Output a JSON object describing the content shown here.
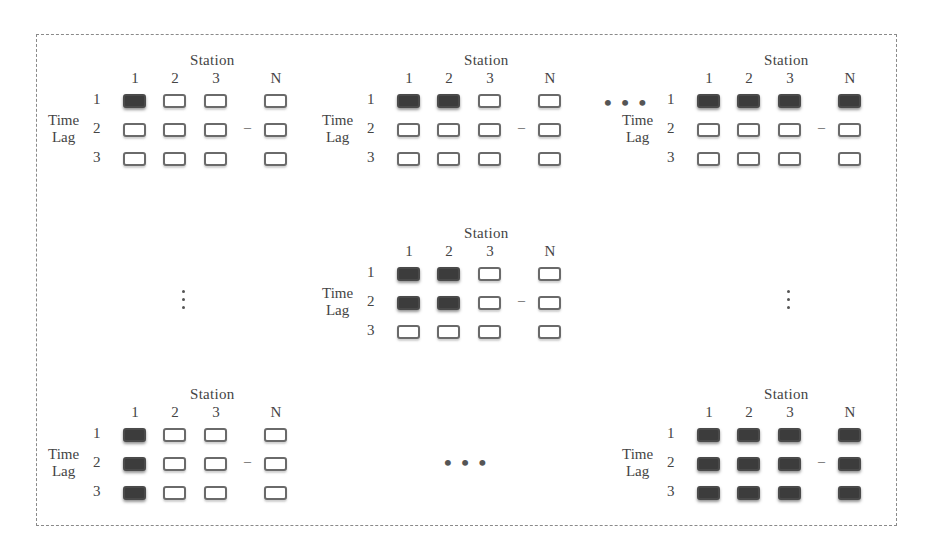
{
  "diagram": {
    "type": "grid-panels",
    "row_axis_label": [
      "Time",
      "Lag"
    ],
    "column_axis_label": "Station",
    "column_labels": [
      "1",
      "2",
      "3",
      "N"
    ],
    "row_labels": [
      "1",
      "2",
      "3"
    ],
    "between_col_ellipsis": "–",
    "horizontal_ellipsis": "• • •",
    "colors": {
      "filled": "#3c3c3c",
      "empty_border": "#6a6a6a",
      "frame": "#8a8a8a"
    },
    "panels": [
      {
        "id": "top-left",
        "filled": [
          [
            1,
            0,
            0,
            0
          ],
          [
            0,
            0,
            0,
            0
          ],
          [
            0,
            0,
            0,
            0
          ]
        ]
      },
      {
        "id": "top-middle",
        "filled": [
          [
            1,
            1,
            0,
            0
          ],
          [
            0,
            0,
            0,
            0
          ],
          [
            0,
            0,
            0,
            0
          ]
        ]
      },
      {
        "id": "top-right",
        "filled": [
          [
            1,
            1,
            1,
            1
          ],
          [
            0,
            0,
            0,
            0
          ],
          [
            0,
            0,
            0,
            0
          ]
        ]
      },
      {
        "id": "center",
        "filled": [
          [
            1,
            1,
            0,
            0
          ],
          [
            1,
            1,
            0,
            0
          ],
          [
            0,
            0,
            0,
            0
          ]
        ]
      },
      {
        "id": "bottom-left",
        "filled": [
          [
            1,
            0,
            0,
            0
          ],
          [
            1,
            0,
            0,
            0
          ],
          [
            1,
            0,
            0,
            0
          ]
        ]
      },
      {
        "id": "bottom-right",
        "filled": [
          [
            1,
            1,
            1,
            1
          ],
          [
            1,
            1,
            1,
            1
          ],
          [
            1,
            1,
            1,
            1
          ]
        ]
      }
    ]
  }
}
